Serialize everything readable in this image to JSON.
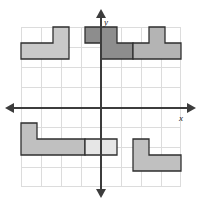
{
  "figure": {
    "type": "coordinate-plane-with-polygons"
  },
  "axes": {
    "x_label": "x",
    "y_label": "y",
    "x_axis_name": "x-axis",
    "y_axis_name": "y-axis",
    "arrow_left": "arrow-left",
    "arrow_right": "arrow-right",
    "arrow_up": "arrow-up",
    "arrow_down": "arrow-down",
    "axis_color": "#3c3c3c"
  },
  "grid": {
    "columns": 8,
    "rows": 8,
    "cell_size_px": 20,
    "origin_col": 4,
    "origin_row": 4,
    "line_color": "#dcdcdc",
    "x_range": [
      -4,
      4
    ],
    "y_range": [
      -4,
      4
    ]
  },
  "colors": {
    "light_gray": "#c9c9c9",
    "mid_gray": "#b4b4b4",
    "dark_gray": "#8d8d8d",
    "pale_gray": "#e6e6e6",
    "outline": "#2e2e2e",
    "grid": "#dcdcdc",
    "axis": "#3c3c3c"
  },
  "shapes": [
    {
      "name": "shape-top-left-L",
      "fill": "#c9c9c9",
      "quadrant": "II",
      "points": "0,20 40,20 40,0 60,0 60,40 0,40",
      "cells": 8
    },
    {
      "name": "shape-top-center-S",
      "fill": "#8d8d8d",
      "quadrant": "I-II",
      "points": "80,0 120,0 120,20 140,20 140,40 100,40 100,20 80,20",
      "cells": 6
    },
    {
      "name": "shape-top-right-T",
      "fill": "#b4b4b4",
      "quadrant": "I",
      "points": "140,20 160,20 160,0 180,0 180,20 200,20 200,40 140,40",
      "cells": 8
    },
    {
      "name": "shape-bottom-left-L",
      "fill": "#c0c0c0",
      "quadrant": "III",
      "points": "0,120 20,120 20,140 80,140 80,160 0,160",
      "cells": 8
    },
    {
      "name": "shape-bottom-center-square",
      "fill": "#e6e6e6",
      "quadrant": "III-IV",
      "points": "80,140 120,140 120,160 80,160",
      "cells": 4
    },
    {
      "name": "shape-bottom-right-L",
      "fill": "#c0c0c0",
      "quadrant": "IV",
      "points": "140,140 160,140 160,160 200,160 200,180 140,180",
      "cells": 6
    }
  ]
}
